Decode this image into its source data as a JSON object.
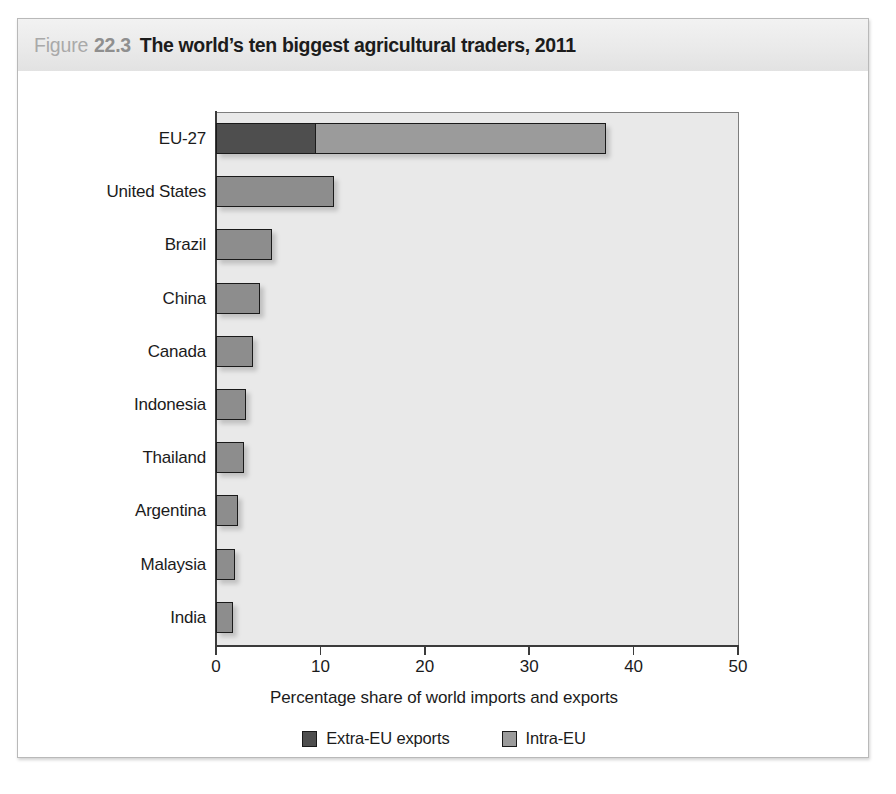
{
  "figure": {
    "label_word": "Figure",
    "number": "22.3",
    "title": "The world’s ten biggest agricultural traders, 2011"
  },
  "colors": {
    "extra_eu": "#4e4e4e",
    "intra_eu": "#9b9b9b",
    "single_bar": "#8d8d8d",
    "plot_background": "#e9e9e9",
    "axis": "#3b3b3b",
    "title_band": "#eaeaea"
  },
  "chart_data": {
    "type": "bar",
    "orientation": "horizontal",
    "stacked": true,
    "title": "The world’s ten biggest agricultural traders, 2011",
    "xlabel": "Percentage share of world imports and exports",
    "ylabel": "",
    "xlim": [
      0,
      50
    ],
    "xticks": [
      0,
      10,
      20,
      30,
      40,
      50
    ],
    "xtick_labels": [
      "0",
      "10",
      "20",
      "30",
      "40",
      "50"
    ],
    "grid": false,
    "legend_position": "bottom",
    "categories": [
      "EU-27",
      "United States",
      "Brazil",
      "China",
      "Canada",
      "Indonesia",
      "Thailand",
      "Argentina",
      "Malaysia",
      "India"
    ],
    "series": [
      {
        "name": "Extra-EU exports",
        "color": "#4e4e4e",
        "values": [
          9.6,
          11.3,
          5.4,
          4.2,
          3.5,
          2.9,
          2.7,
          2.1,
          1.8,
          1.6
        ]
      },
      {
        "name": "Intra-EU",
        "color": "#9b9b9b",
        "values": [
          27.8,
          0,
          0,
          0,
          0,
          0,
          0,
          0,
          0,
          0
        ]
      }
    ],
    "totals": [
      37.4,
      11.3,
      5.4,
      4.2,
      3.5,
      2.9,
      2.7,
      2.1,
      1.8,
      1.6
    ]
  },
  "legend": [
    {
      "label": "Extra-EU exports",
      "swatch": "extra"
    },
    {
      "label": "Intra-EU",
      "swatch": "intra"
    }
  ]
}
